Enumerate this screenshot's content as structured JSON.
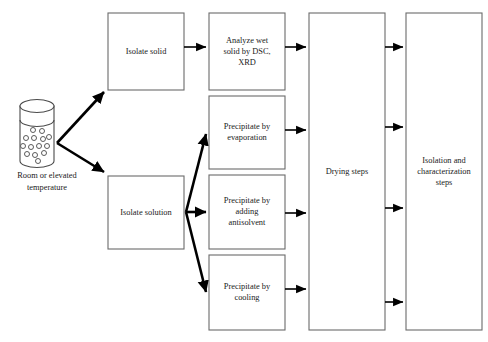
{
  "diagram": {
    "background_color": "#ffffff",
    "box_border_color": "#6b6b6b",
    "arrow_color": "#000000",
    "text_color": "#1a1a1a",
    "source": {
      "name": "sample-vessel",
      "caption_line_1": "Room or elevated",
      "caption_line_2": "temperature",
      "particle_count": 14
    },
    "nodes": [
      {
        "id": "isolate-solid",
        "lines": [
          "Isolate solid"
        ],
        "x": 108,
        "y": 13,
        "width": 76,
        "height": 77
      },
      {
        "id": "isolate-solution",
        "lines": [
          "Isolate solution"
        ],
        "x": 108,
        "y": 176,
        "width": 76,
        "height": 73
      },
      {
        "id": "analyze-wet-solid",
        "lines": [
          "Analyze wet",
          "solid by DSC,",
          "XRD"
        ],
        "x": 209,
        "y": 13,
        "width": 76,
        "height": 77
      },
      {
        "id": "precipitate-evaporation",
        "lines": [
          "Precipitate by",
          "evaporation"
        ],
        "x": 209,
        "y": 96,
        "width": 76,
        "height": 73
      },
      {
        "id": "precipitate-antisolvent",
        "lines": [
          "Precipitate by",
          "adding",
          "antisolvent"
        ],
        "x": 209,
        "y": 175,
        "width": 76,
        "height": 74
      },
      {
        "id": "precipitate-cooling",
        "lines": [
          "Precipitate by",
          "cooling"
        ],
        "x": 209,
        "y": 255,
        "width": 76,
        "height": 75
      },
      {
        "id": "drying-steps",
        "lines": [
          "Drying steps"
        ],
        "x": 309,
        "y": 13,
        "width": 76,
        "height": 317
      },
      {
        "id": "isolation-characterization",
        "lines": [
          "Isolation and",
          "characterization",
          "steps"
        ],
        "x": 406,
        "y": 13,
        "width": 76,
        "height": 317
      }
    ],
    "edges": [
      {
        "id": "vessel-to-isolate-solid",
        "style": "thick",
        "from": "sample-vessel",
        "to": "isolate-solid"
      },
      {
        "id": "vessel-to-isolate-solution",
        "style": "thick",
        "from": "sample-vessel",
        "to": "isolate-solution"
      },
      {
        "id": "isolate-solid-to-analyze",
        "style": "thin",
        "from": "isolate-solid",
        "to": "analyze-wet-solid"
      },
      {
        "id": "isolate-solution-to-evaporation",
        "style": "thick",
        "from": "isolate-solution",
        "to": "precipitate-evaporation"
      },
      {
        "id": "isolate-solution-to-antisolvent",
        "style": "thick",
        "from": "isolate-solution",
        "to": "precipitate-antisolvent"
      },
      {
        "id": "isolate-solution-to-cooling",
        "style": "thick",
        "from": "isolate-solution",
        "to": "precipitate-cooling"
      },
      {
        "id": "analyze-to-drying",
        "style": "thin",
        "from": "analyze-wet-solid",
        "to": "drying-steps"
      },
      {
        "id": "evaporation-to-drying",
        "style": "thin",
        "from": "precipitate-evaporation",
        "to": "drying-steps"
      },
      {
        "id": "antisolvent-to-drying",
        "style": "thin",
        "from": "precipitate-antisolvent",
        "to": "drying-steps"
      },
      {
        "id": "cooling-to-drying",
        "style": "thin",
        "from": "precipitate-cooling",
        "to": "drying-steps"
      },
      {
        "id": "drying-to-isolation-1",
        "style": "thin",
        "from": "drying-steps",
        "to": "isolation-characterization"
      },
      {
        "id": "drying-to-isolation-2",
        "style": "thin",
        "from": "drying-steps",
        "to": "isolation-characterization"
      },
      {
        "id": "drying-to-isolation-3",
        "style": "thin",
        "from": "drying-steps",
        "to": "isolation-characterization"
      },
      {
        "id": "drying-to-isolation-4",
        "style": "thin",
        "from": "drying-steps",
        "to": "isolation-characterization"
      }
    ]
  }
}
